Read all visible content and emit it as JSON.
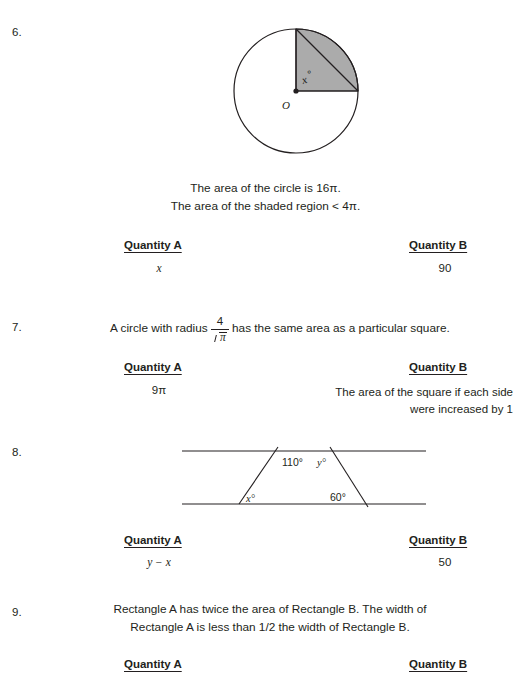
{
  "page": {
    "width": 531,
    "height": 676,
    "background": "#ffffff",
    "text_color": "#231f20",
    "shade_color": "#ababab",
    "line_color": "#231f20"
  },
  "common": {
    "quantity_a_label": "Quantity A",
    "quantity_b_label": "Quantity B"
  },
  "problems": [
    {
      "number": "6.",
      "figure": {
        "type": "circle-with-shaded-quarter-sector",
        "center_label": "O",
        "angle_label": "x",
        "angle_degree_symbol": "°",
        "shaded_region": "upper-right quarter sector",
        "chord": "from top of circle to right of circle"
      },
      "statements": [
        "The area of the circle is 16π.",
        "The area of the shaded region < 4π."
      ],
      "quantity_a_value": "x",
      "quantity_b_value": "90"
    },
    {
      "number": "7.",
      "stem_before": "A circle with radius",
      "fraction": {
        "numerator": "4",
        "denominator_radicand": "π"
      },
      "stem_after": "has the same area as a particular square.",
      "quantity_a_value": "9π",
      "quantity_b_value": "The area of the square if each side were increased by 1"
    },
    {
      "number": "8.",
      "figure": {
        "type": "two-parallel-lines-with-transversals",
        "angles": [
          {
            "name": "upper-left-interior",
            "label": "110°"
          },
          {
            "name": "upper-right-interior",
            "label": "y°"
          },
          {
            "name": "lower-left-interior",
            "label": "x°"
          },
          {
            "name": "lower-right-interior",
            "label": "60°"
          }
        ]
      },
      "quantity_a_value": "y − x",
      "quantity_b_value": "50"
    },
    {
      "number": "9.",
      "statements": [
        "Rectangle A has twice the area of Rectangle B. The width of",
        "Rectangle A is less than 1/2 the width of Rectangle B."
      ]
    }
  ]
}
